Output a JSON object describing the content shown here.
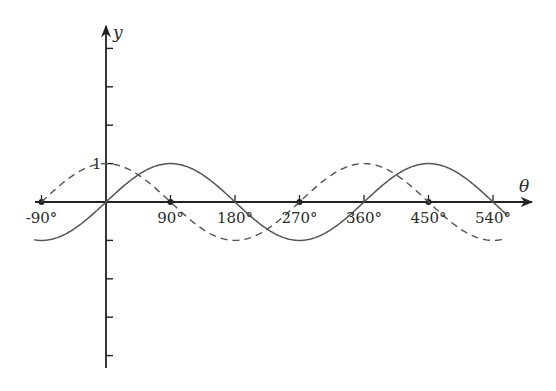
{
  "chart_data": {
    "type": "line",
    "title": "",
    "xlabel": "θ",
    "ylabel": "y",
    "x_unit": "degrees",
    "xlim": [
      -110,
      560
    ],
    "ylim": [
      -4,
      4
    ],
    "grid": false,
    "legend": null,
    "x_tick_labels": [
      "-90°",
      "90°",
      "180°",
      "270°",
      "360°",
      "450°",
      "540°"
    ],
    "x_ticks": [
      -90,
      90,
      180,
      270,
      360,
      450,
      540
    ],
    "x_tick_markers": {
      "dots": [
        -90,
        90,
        270,
        450
      ],
      "ticks": [
        180,
        360,
        540
      ]
    },
    "y_tick_labels": [
      "1"
    ],
    "y_ticks": [
      -4,
      -3,
      -2,
      -1,
      1,
      2,
      3,
      4
    ],
    "series": [
      {
        "name": "y = sin θ",
        "style": "solid",
        "color": "#555555",
        "x_range": [
          -100,
          560
        ],
        "x": [
          -90,
          0,
          90,
          180,
          270,
          360,
          450,
          540
        ],
        "values": [
          -1,
          0,
          1,
          0,
          -1,
          0,
          1,
          0
        ]
      },
      {
        "name": "y = cos θ",
        "style": "dashed",
        "color": "#555555",
        "x_range": [
          -90,
          555
        ],
        "x": [
          -90,
          0,
          90,
          180,
          270,
          360,
          450,
          540
        ],
        "values": [
          0,
          1,
          0,
          -1,
          0,
          1,
          0,
          -1
        ]
      }
    ]
  },
  "colors": {
    "axis": "#222222",
    "curve": "#555555",
    "background": "#ffffff"
  }
}
